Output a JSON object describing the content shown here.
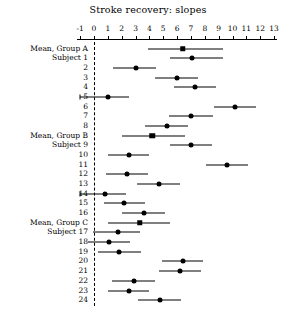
{
  "chart_data": {
    "type": "scatter",
    "plot_style": "forest-plot",
    "title": "Stroke recovery: slopes",
    "xlabel": "",
    "ylabel": "",
    "xlim": [
      -1,
      13
    ],
    "xticks": [
      -1,
      0,
      1,
      2,
      3,
      4,
      5,
      6,
      7,
      8,
      9,
      10,
      11,
      12,
      13
    ],
    "xtick_labels": [
      "-1",
      "0",
      "1",
      "2",
      "3",
      "4",
      "5",
      "6",
      "7",
      "8",
      "9",
      "10",
      "11",
      "12",
      "13"
    ],
    "grid": false,
    "legend": null,
    "reference_line": {
      "x": 0,
      "style": "dashed",
      "color": "#000000"
    },
    "marker_legend": {
      "square": "group mean",
      "circle": "subject estimate"
    },
    "rows": [
      {
        "label": "Mean, Group A",
        "marker": "square",
        "estimate": 6.4,
        "low": 3.9,
        "high": 9.3
      },
      {
        "label": "Subject 1",
        "marker": "circle",
        "estimate": 7.1,
        "low": 5.5,
        "high": 9.3
      },
      {
        "label": "2",
        "marker": "circle",
        "estimate": 3.0,
        "low": 1.4,
        "high": 4.5
      },
      {
        "label": "3",
        "marker": "circle",
        "estimate": 6.0,
        "low": 4.4,
        "high": 7.5
      },
      {
        "label": "4",
        "marker": "circle",
        "estimate": 7.3,
        "low": 5.8,
        "high": 8.8
      },
      {
        "label": "5",
        "marker": "circle",
        "estimate": 1.0,
        "low": -1.0,
        "high": 2.5
      },
      {
        "label": "6",
        "marker": "circle",
        "estimate": 10.2,
        "low": 8.7,
        "high": 11.7
      },
      {
        "label": "7",
        "marker": "circle",
        "estimate": 7.0,
        "low": 5.4,
        "high": 8.6
      },
      {
        "label": "8",
        "marker": "circle",
        "estimate": 5.3,
        "low": 3.7,
        "high": 6.8
      },
      {
        "label": "Mean, Group B",
        "marker": "square",
        "estimate": 4.2,
        "low": 2.0,
        "high": 6.6
      },
      {
        "label": "Subject 9",
        "marker": "circle",
        "estimate": 7.0,
        "low": 5.5,
        "high": 8.5
      },
      {
        "label": "10",
        "marker": "circle",
        "estimate": 2.5,
        "low": 1.0,
        "high": 4.0
      },
      {
        "label": "11",
        "marker": "circle",
        "estimate": 9.6,
        "low": 8.1,
        "high": 11.1
      },
      {
        "label": "12",
        "marker": "circle",
        "estimate": 2.4,
        "low": 0.9,
        "high": 3.9
      },
      {
        "label": "13",
        "marker": "circle",
        "estimate": 4.7,
        "low": 3.1,
        "high": 6.2
      },
      {
        "label": "14",
        "marker": "circle",
        "estimate": 0.8,
        "low": -1.0,
        "high": 2.3
      },
      {
        "label": "15",
        "marker": "circle",
        "estimate": 2.2,
        "low": 0.7,
        "high": 3.7
      },
      {
        "label": "16",
        "marker": "circle",
        "estimate": 3.6,
        "low": 2.0,
        "high": 5.1
      },
      {
        "label": "Mean, Group C",
        "marker": "square",
        "estimate": 3.3,
        "low": 1.0,
        "high": 5.5
      },
      {
        "label": "Subject 17",
        "marker": "circle",
        "estimate": 1.7,
        "low": -0.1,
        "high": 3.3
      },
      {
        "label": "18",
        "marker": "circle",
        "estimate": 1.1,
        "low": -0.4,
        "high": 2.6
      },
      {
        "label": "19",
        "marker": "circle",
        "estimate": 1.8,
        "low": 0.3,
        "high": 3.4
      },
      {
        "label": "20",
        "marker": "circle",
        "estimate": 6.4,
        "low": 4.9,
        "high": 7.9
      },
      {
        "label": "21",
        "marker": "circle",
        "estimate": 6.2,
        "low": 4.7,
        "high": 7.7
      },
      {
        "label": "22",
        "marker": "circle",
        "estimate": 2.9,
        "low": 1.3,
        "high": 4.4
      },
      {
        "label": "23",
        "marker": "circle",
        "estimate": 2.5,
        "low": 1.0,
        "high": 4.0
      },
      {
        "label": "24",
        "marker": "circle",
        "estimate": 4.8,
        "low": 3.2,
        "high": 6.3
      }
    ]
  },
  "geometry": {
    "x_at_zero": 94,
    "px_per_unit": 13.85,
    "first_row_y": 48.5,
    "row_spacing": 9.68,
    "label_column_right": 88,
    "axis_y": 38.5
  }
}
